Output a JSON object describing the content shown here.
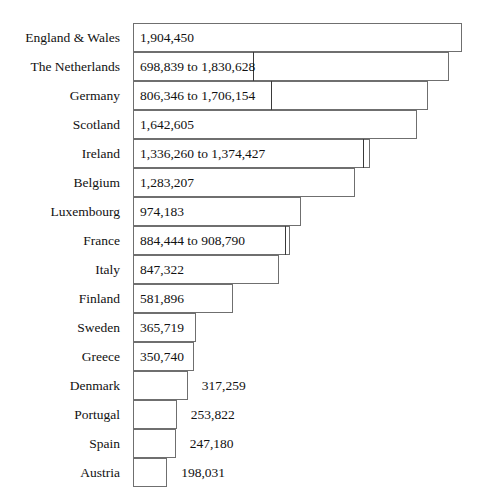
{
  "chart_data": {
    "type": "bar",
    "title": "",
    "subtitle": "",
    "xlabel": "",
    "ylabel": "",
    "orientation": "horizontal",
    "grid": false,
    "legend": null,
    "axis_visible": false,
    "xlim": [
      0,
      2000000
    ],
    "categories": [
      "England & Wales",
      "The Netherlands",
      "Germany",
      "Scotland",
      "Ireland",
      "Belgium",
      "Luxembourg",
      "France",
      "Italy",
      "Finland",
      "Sweden",
      "Greece",
      "Denmark",
      "Portugal",
      "Spain",
      "Austria"
    ],
    "values": [
      1904450,
      1830628,
      1706154,
      1642605,
      1374427,
      1283207,
      974183,
      908790,
      847322,
      581896,
      365719,
      350740,
      317259,
      253822,
      247180,
      198031
    ],
    "ranges": [
      null,
      [
        698839,
        1830628
      ],
      [
        806346,
        1706154
      ],
      null,
      [
        1336260,
        1374427
      ],
      null,
      null,
      [
        884444,
        908790
      ],
      null,
      null,
      null,
      null,
      null,
      null,
      null,
      null
    ],
    "data_labels": [
      "1,904,450",
      "698,839 to 1,830,628",
      "806,346 to 1,706,154",
      "1,642,605",
      "1,336,260 to 1,374,427",
      "1,283,207",
      "974,183",
      "884,444 to 908,790",
      "847,322",
      "581,896",
      "365,719",
      "350,740",
      "317,259",
      "253,822",
      "247,180",
      "198,031"
    ],
    "label_placement": [
      "inside",
      "inside",
      "inside",
      "inside",
      "inside",
      "inside",
      "inside",
      "inside",
      "inside",
      "inside",
      "inside",
      "inside",
      "outside",
      "outside",
      "outside",
      "outside"
    ],
    "bar_fill_color": "#ffffff",
    "bar_border_color": "#6f6f6f",
    "range_divider_color": "#3a3a3a",
    "text_color": "#111111",
    "background_color": "#ffffff"
  },
  "layout": {
    "bar_origin_x": 133,
    "first_row_y": 23,
    "row_height": 29,
    "pixels_per_unit": 0.0001727,
    "label_column_width": 120,
    "outside_label_offset": 14
  }
}
